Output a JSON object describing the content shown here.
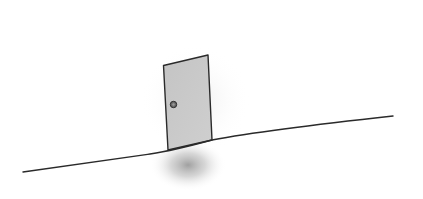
{
  "scene": {
    "description": "Hand-drawn sketch of a lone door standing on a sloped hill line",
    "background": "#ffffff",
    "ink_color": "#2a2a2a",
    "door": {
      "fill": "#c9c9c9",
      "knob_fill": "#6a6a6a"
    },
    "shadow_color": "#9a9a9a"
  }
}
